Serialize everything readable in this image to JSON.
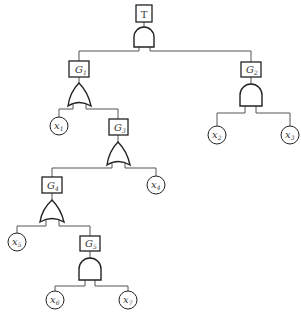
{
  "diagram": {
    "type": "fault-tree",
    "top_event": {
      "label": "T",
      "gate": "AND"
    },
    "gates": [
      {
        "id": "G1",
        "main": "G",
        "sub": "1",
        "gate": "OR"
      },
      {
        "id": "G2",
        "main": "G",
        "sub": "2",
        "gate": "AND"
      },
      {
        "id": "G3",
        "main": "G",
        "sub": "3",
        "gate": "OR"
      },
      {
        "id": "G4",
        "main": "G",
        "sub": "4",
        "gate": "OR"
      },
      {
        "id": "G5",
        "main": "G",
        "sub": "5",
        "gate": "AND"
      }
    ],
    "basic_events": [
      {
        "id": "x1",
        "main": "x",
        "sub": "1"
      },
      {
        "id": "x2",
        "main": "x",
        "sub": "2"
      },
      {
        "id": "x3",
        "main": "x",
        "sub": "3"
      },
      {
        "id": "x4",
        "main": "x",
        "sub": "4"
      },
      {
        "id": "x5",
        "main": "x",
        "sub": "5"
      },
      {
        "id": "x6",
        "main": "x",
        "sub": "6"
      },
      {
        "id": "x7",
        "main": "x",
        "sub": "7"
      }
    ],
    "edges": [
      [
        "T",
        "G1"
      ],
      [
        "T",
        "G2"
      ],
      [
        "G1",
        "x1"
      ],
      [
        "G1",
        "G3"
      ],
      [
        "G2",
        "x2"
      ],
      [
        "G2",
        "x3"
      ],
      [
        "G3",
        "G4"
      ],
      [
        "G3",
        "x4"
      ],
      [
        "G4",
        "x5"
      ],
      [
        "G4",
        "G5"
      ],
      [
        "G5",
        "x6"
      ],
      [
        "G5",
        "x7"
      ]
    ]
  }
}
